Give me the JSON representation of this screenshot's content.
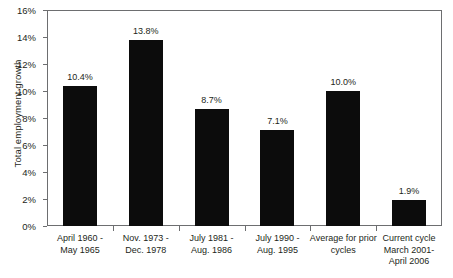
{
  "chart_data": {
    "type": "bar",
    "title": "",
    "xlabel": "",
    "ylabel": "Total employment growth",
    "ylim": [
      0,
      16
    ],
    "ytick_step": 2,
    "ytick_labels": [
      "0%",
      "2%",
      "4%",
      "6%",
      "8%",
      "10%",
      "12%",
      "14%",
      "16%"
    ],
    "ytick_values": [
      0,
      2,
      4,
      6,
      8,
      10,
      12,
      14,
      16
    ],
    "grid": false,
    "legend": false,
    "bar_color": "#0c0c0c",
    "axis_color": "#6d6e70",
    "background": "#ffffff",
    "categories": [
      "April 1960 - May 1965",
      "Nov. 1973 - Dec. 1978",
      "July 1981 - Aug. 1986",
      "July 1990 - Aug. 1995",
      "Average for prior cycles",
      "Current cycle March 2001- April 2006"
    ],
    "category_lines": [
      [
        "April 1960 -",
        "May 1965"
      ],
      [
        "Nov. 1973 -",
        "Dec. 1978"
      ],
      [
        "July 1981 -",
        "Aug. 1986"
      ],
      [
        "July 1990 -",
        "Aug. 1995"
      ],
      [
        "Average for prior",
        "cycles"
      ],
      [
        "Current cycle",
        "March 2001-",
        "April 2006"
      ]
    ],
    "values": [
      10.4,
      13.8,
      8.7,
      7.1,
      10.0,
      1.9
    ],
    "value_labels": [
      "10.4%",
      "13.8%",
      "8.7%",
      "7.1%",
      "10.0%",
      "1.9%"
    ]
  }
}
